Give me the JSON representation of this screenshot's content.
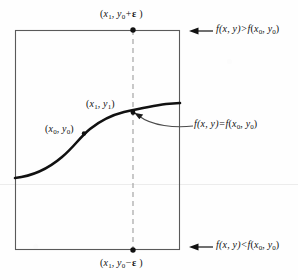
{
  "figure": {
    "kind": "math-diagram",
    "colors": {
      "ink": "#111111",
      "box_stroke": "#555555",
      "dash_stroke": "#9a9a9a",
      "leader_stroke": "#4a4a4a",
      "scanline": "#e9e9e9",
      "background": "#fefefe"
    }
  },
  "labels": {
    "top_point": {
      "open": "(",
      "var1": "x",
      "sub1": "1",
      "comma": ", ",
      "var2": "y",
      "sub2": "0",
      "op": "+",
      "eps": "ε",
      "close": " )"
    },
    "bottom_point": {
      "open": "(",
      "var1": "x",
      "sub1": "1",
      "comma": ", ",
      "var2": "y",
      "sub2": "0",
      "op": "−",
      "eps": "ε",
      "close": " )"
    },
    "curve_point_x1y1": {
      "open": "(",
      "var1": "x",
      "sub1": "1",
      "comma": ", ",
      "var2": "y",
      "sub2": "1",
      "close": ")"
    },
    "curve_point_x0y0": {
      "open": "(",
      "var1": "x",
      "sub1": "0",
      "comma": ", ",
      "var2": "y",
      "sub2": "0",
      "close": ")"
    }
  },
  "annotations": {
    "greater": {
      "lhs_f": "f",
      "lhs_args": "(x, y)",
      "relation": ">",
      "rhs_f": "f",
      "rhs_open": "(",
      "rhs_var1": "x",
      "rhs_sub1": "0",
      "rhs_comma": ", ",
      "rhs_var2": "y",
      "rhs_sub2": "0",
      "rhs_close": ")"
    },
    "equal": {
      "lhs_f": "f",
      "lhs_args": "(x, y)",
      "relation": "=",
      "rhs_f": "f",
      "rhs_open": "(",
      "rhs_var1": "x",
      "rhs_sub1": "0",
      "rhs_comma": ", ",
      "rhs_var2": "y",
      "rhs_sub2": "0",
      "rhs_close": ")"
    },
    "less": {
      "lhs_f": "f",
      "lhs_args": "(x, y)",
      "relation": "<",
      "rhs_f": "f",
      "rhs_open": "(",
      "rhs_var1": "x",
      "rhs_sub1": "0",
      "rhs_comma": ", ",
      "rhs_var2": "y",
      "rhs_sub2": "0",
      "rhs_close": ")"
    }
  },
  "geometry": {
    "box": {
      "x": 15,
      "y": 30,
      "width": 165,
      "height": 220
    },
    "dashed_line_x": 133,
    "curve_start": {
      "x": 15,
      "y": 178
    },
    "curve_end": {
      "x": 180,
      "y": 103
    },
    "point_top": {
      "x": 133,
      "y": 30
    },
    "point_bottom": {
      "x": 133,
      "y": 250
    },
    "point_x1y1": {
      "x": 133,
      "y": 113
    },
    "point_x0y0": {
      "x": 80,
      "y": 137
    },
    "scanline_y": 184
  }
}
